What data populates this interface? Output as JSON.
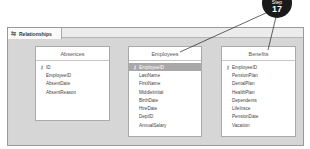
{
  "tab": {
    "label": "Relationships",
    "icon": "relationships-icon"
  },
  "callout": {
    "step_label": "Step",
    "number": "17"
  },
  "tables": [
    {
      "name": "Absences",
      "fields": [
        {
          "name": "ID",
          "key": true
        },
        {
          "name": "EmployeeID"
        },
        {
          "name": "AbsentDate"
        },
        {
          "name": "AbsentReason"
        }
      ]
    },
    {
      "name": "Employees",
      "fields": [
        {
          "name": "EmployeeID",
          "key": true,
          "selected": true
        },
        {
          "name": "LastName"
        },
        {
          "name": "FirstName"
        },
        {
          "name": "MiddleInitial"
        },
        {
          "name": "BirthDate"
        },
        {
          "name": "HireDate"
        },
        {
          "name": "DeptID"
        },
        {
          "name": "AnnualSalary"
        }
      ]
    },
    {
      "name": "Benefits",
      "fields": [
        {
          "name": "EmployeeID",
          "key": true
        },
        {
          "name": "PensionPlan"
        },
        {
          "name": "DentalPlan"
        },
        {
          "name": "HealthPlan"
        },
        {
          "name": "Dependents"
        },
        {
          "name": "LifeInsce"
        },
        {
          "name": "PensionDate"
        },
        {
          "name": "Vacation"
        }
      ]
    }
  ]
}
